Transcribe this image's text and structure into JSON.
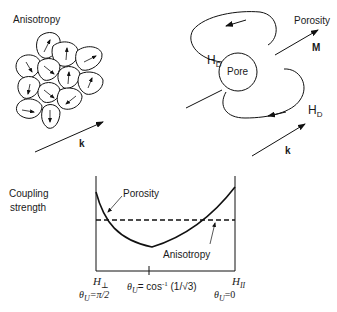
{
  "anisotropy_panel": {
    "title": "Anisotropy",
    "wave_vector_label": "k",
    "grain_count": 13
  },
  "porosity_panel": {
    "title": "Porosity",
    "pore_label": "Pore",
    "magnetization_label": "M",
    "demag_field_label_top": "H",
    "demag_field_label_bottom": "H",
    "demag_field_subscript": "D",
    "wave_vector_label": "k"
  },
  "coupling_plot": {
    "y_label_line1": "Coupling",
    "y_label_line2": "strength",
    "curve_porosity_label": "Porosity",
    "curve_anisotropy_label": "Anisotropy",
    "x_left_label": "H",
    "x_left_subscript": "⊥",
    "x_left_angle": "θ",
    "x_left_angle_sub": "U",
    "x_left_angle_value": "=π/2",
    "x_mid_angle": "θ",
    "x_mid_angle_sub": "U",
    "x_mid_prefix": "= cos",
    "x_mid_sup": "-1",
    "x_mid_arg": " (1/√3)",
    "x_right_label": "H",
    "x_right_subscript": "II",
    "x_right_angle": "θ",
    "x_right_angle_sub": "U",
    "x_right_angle_value": "=0"
  }
}
